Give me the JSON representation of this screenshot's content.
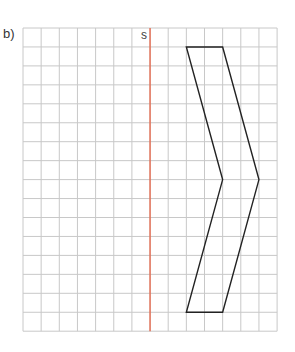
{
  "exercise": {
    "label": "b)",
    "axis_label": "s"
  },
  "grid": {
    "columns": 14,
    "rows": 16,
    "origin_x": 23,
    "origin_y": 28,
    "cell_w": 18.15,
    "cell_h": 18.95,
    "line_color": "#c8c8c8"
  },
  "symmetry_axis": {
    "column": 7,
    "color": "#e8593a"
  },
  "shape": {
    "stroke": "#222222",
    "vertices_grid": [
      [
        9,
        1
      ],
      [
        11,
        1
      ],
      [
        13,
        8
      ],
      [
        11,
        15
      ],
      [
        9,
        15
      ],
      [
        11,
        8
      ]
    ]
  }
}
